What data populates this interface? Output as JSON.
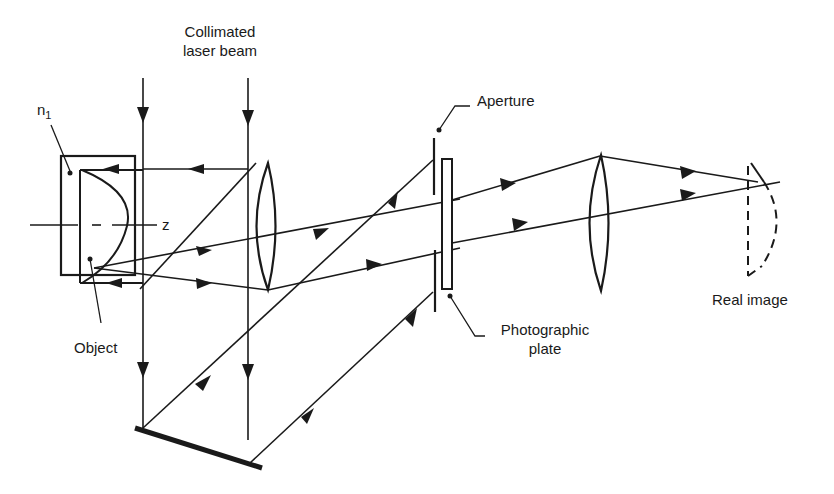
{
  "diagram": {
    "type": "holography-optical-setup",
    "labels": {
      "beam_line1": "Collimated",
      "beam_line2": "laser beam",
      "n1": "n",
      "n1_sub": "1",
      "z": "z",
      "object": "Object",
      "aperture": "Aperture",
      "plate_line1": "Photographic",
      "plate_line2": "plate",
      "real_image": "Real image"
    },
    "components": [
      "collimated laser beam",
      "immersion cell (n1)",
      "object",
      "beam splitter",
      "lens 1",
      "mirror",
      "aperture",
      "photographic plate",
      "lens 2",
      "real image"
    ],
    "colors": {
      "ink": "#1a1a1a",
      "background": "#ffffff"
    }
  }
}
